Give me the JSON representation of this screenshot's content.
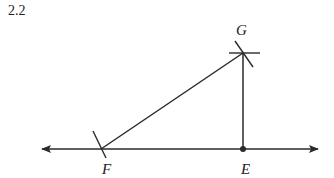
{
  "figure": {
    "number": "2.2"
  },
  "diagram": {
    "colors": {
      "stroke": "#2a2a2a",
      "text": "#222222"
    },
    "points": {
      "G": {
        "label": "G",
        "x": 243,
        "y": 53
      },
      "F": {
        "label": "F",
        "x": 101,
        "y": 149
      },
      "E": {
        "label": "E",
        "x": 243,
        "y": 149
      }
    },
    "line": {
      "x1": 42,
      "x2": 318,
      "y": 149,
      "arrows": "both"
    },
    "segments": [
      {
        "from": "F",
        "to": "G"
      },
      {
        "from": "G",
        "to": "E"
      }
    ],
    "arc_marks": [
      "G-horizontal",
      "G-slanted",
      "F-slanted"
    ]
  }
}
